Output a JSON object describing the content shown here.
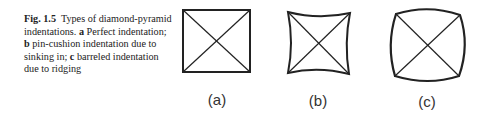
{
  "caption": {
    "figure_label": "Fig. 1.5",
    "title": "Types of diamond-pyramid indentations.",
    "items": [
      {
        "key": "a",
        "text": "Perfect indentation;"
      },
      {
        "key": "b",
        "text": "pin-cushion indentation due to sinking in;"
      },
      {
        "key": "c",
        "text": "barreled indentation due to ridging"
      }
    ]
  },
  "panels": [
    {
      "label": "(a)",
      "shape": "perfect-square"
    },
    {
      "label": "(b)",
      "shape": "pin-cushion"
    },
    {
      "label": "(c)",
      "shape": "barreled"
    }
  ]
}
